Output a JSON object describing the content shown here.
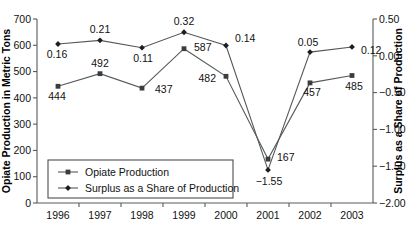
{
  "chart_data": {
    "type": "line",
    "title": "",
    "categories": [
      "1996",
      "1997",
      "1998",
      "1999",
      "2000",
      "2001",
      "2002",
      "2003"
    ],
    "series": [
      {
        "name": "Opiate Production",
        "axis": "left",
        "marker": "square",
        "values": [
          444,
          492,
          437,
          587,
          482,
          167,
          457,
          485
        ],
        "labels": [
          "444",
          "492",
          "437",
          "587",
          "482",
          "167",
          "457",
          "485"
        ]
      },
      {
        "name": "Surplus as a Share of Production",
        "axis": "right",
        "marker": "diamond",
        "values": [
          0.16,
          0.21,
          0.11,
          0.32,
          0.14,
          -1.55,
          0.05,
          0.12
        ],
        "labels": [
          "0.16",
          "0.21",
          "0.11",
          "0.32",
          "0.14",
          "−1.55",
          "0.05",
          "0.12"
        ]
      }
    ],
    "ylabel": "Opiate Production in Metric Tons",
    "y2label": "Surplus as a Share of Production",
    "xlabel": "",
    "ylim": [
      0,
      700
    ],
    "y2lim": [
      -2.0,
      0.5
    ],
    "yticks": [
      "0",
      "100",
      "200",
      "300",
      "400",
      "500",
      "600",
      "700"
    ],
    "y2ticks": [
      "−2.00",
      "−1.50",
      "−1.00",
      "−0.50",
      "0.00",
      "0.50"
    ],
    "grid": false,
    "legend_position": "inside-bottom-left",
    "legend_entries": [
      "Opiate Production",
      "Surplus as a Share of Production"
    ],
    "colors": {
      "line": "#56595a",
      "marker_square": "#3a3d3e",
      "marker_diamond": "#1b1d1e",
      "axis": "#555c5c",
      "text": "#111111",
      "background": "#ffffff"
    }
  }
}
